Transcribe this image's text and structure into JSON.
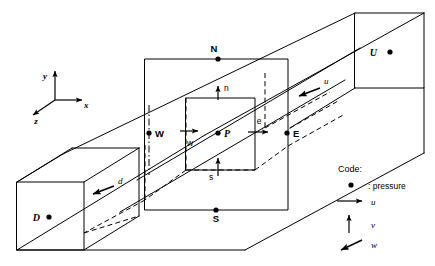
{
  "figure": {
    "background_color": "#ffffff",
    "line_color": "#000000"
  },
  "axes": {
    "x_label": "x",
    "y_label": "y",
    "z_label": "z"
  },
  "nodes": [
    {
      "id": "N",
      "label": "N",
      "style": "upright",
      "x": 218,
      "y": 59
    },
    {
      "id": "S",
      "label": "S",
      "style": "upright",
      "x": 216,
      "y": 210
    },
    {
      "id": "W",
      "label": "W",
      "style": "upright",
      "x": 149,
      "y": 133
    },
    {
      "id": "E",
      "label": "E",
      "style": "upright",
      "x": 287,
      "y": 133
    },
    {
      "id": "P",
      "label": "P",
      "style": "italic",
      "x": 218,
      "y": 133
    },
    {
      "id": "U",
      "label": "U",
      "style": "italic",
      "x": 390,
      "y": 52
    },
    {
      "id": "D",
      "label": "D",
      "style": "italic",
      "x": 49,
      "y": 217
    }
  ],
  "faces": [
    {
      "id": "n",
      "label": "n",
      "direction": "up"
    },
    {
      "id": "s",
      "label": "s",
      "direction": "up"
    },
    {
      "id": "w",
      "label": "w",
      "direction": "right"
    },
    {
      "id": "e",
      "label": "e",
      "direction": "right"
    },
    {
      "id": "u",
      "label": "u",
      "direction": "down-left"
    },
    {
      "id": "d",
      "label": "d",
      "direction": "left"
    }
  ],
  "legend": {
    "title": "Code:",
    "items": [
      {
        "symbol": "dot",
        "label": ": pressure"
      },
      {
        "symbol": "arrow-right",
        "label": "u"
      },
      {
        "symbol": "arrow-up",
        "label": "v"
      },
      {
        "symbol": "arrow-down-left",
        "label": "w"
      }
    ]
  }
}
